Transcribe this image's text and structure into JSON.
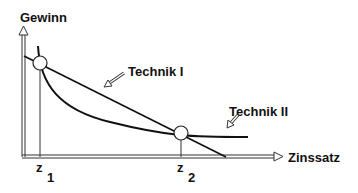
{
  "diagram": {
    "y_axis_label": "Gewinn",
    "x_axis_label": "Zinssatz",
    "curves": [
      {
        "name": "Technik I",
        "shape": "straight line, decreasing"
      },
      {
        "name": "Technik II",
        "shape": "convex curve, decreasing"
      }
    ],
    "labels": {
      "technik1": "Technik I",
      "technik2": "Technik II",
      "z1_main": "z",
      "z1_sub": "1",
      "z2_main": "z",
      "z2_sub": "2"
    },
    "intersections": [
      "z1",
      "z2"
    ],
    "colors": {
      "line": "#111111",
      "axis": "#555555",
      "background": "#ffffff"
    }
  }
}
